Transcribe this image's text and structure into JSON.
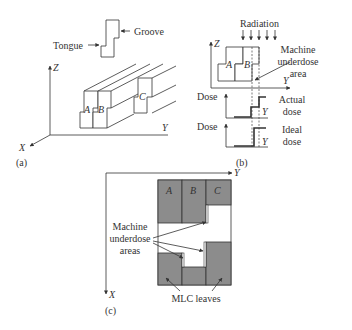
{
  "figure": {
    "panel_a": {
      "caption": "(a)",
      "tongue_label": "Tongue",
      "groove_label": "Groove",
      "axis_x": "X",
      "axis_y": "Y",
      "axis_z": "Z",
      "leaf_a": "A",
      "leaf_b": "B",
      "leaf_c": "C"
    },
    "panel_b": {
      "caption": "(b)",
      "radiation_label": "Radiation",
      "axis_z": "Z",
      "axis_y": "Y",
      "leaf_a": "A",
      "leaf_b": "B",
      "underdose_label_1": "Machine",
      "underdose_label_2": "underdose",
      "underdose_label_3": "area",
      "dose_label_actual": "Dose",
      "dose_label_ideal": "Dose",
      "actual_label_1": "Actual",
      "actual_label_2": "dose",
      "ideal_label_1": "Ideal",
      "ideal_label_2": "dose",
      "axis_y_actual": "Y",
      "axis_y_ideal": "Y"
    },
    "panel_c": {
      "caption": "(c)",
      "axis_x": "X",
      "axis_y": "Y",
      "leaf_a": "A",
      "leaf_b": "B",
      "leaf_c": "C",
      "underdose_label_1": "Machine",
      "underdose_label_2": "underdose",
      "underdose_label_3": "areas",
      "mlc_label": "MLC leaves"
    }
  }
}
